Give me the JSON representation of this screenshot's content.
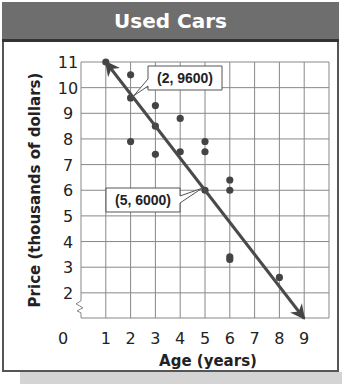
{
  "title": "Used Cars",
  "chart_data": {
    "type": "scatter",
    "title": "Used Cars",
    "xlabel": "Age (years)",
    "ylabel": "Price (thousands of dollars)",
    "xlim": [
      0,
      10
    ],
    "ylim": [
      0,
      11
    ],
    "y_axis_break": true,
    "grid": true,
    "x_ticks": [
      "0",
      "1",
      "2",
      "3",
      "4",
      "5",
      "6",
      "7",
      "8",
      "9"
    ],
    "y_ticks": [
      "11",
      "10",
      "9",
      "8",
      "7",
      "6",
      "5",
      "4",
      "3",
      "2"
    ],
    "y_zero_label": "0",
    "points": [
      {
        "x": 1,
        "y": 11.0
      },
      {
        "x": 2,
        "y": 10.5
      },
      {
        "x": 2,
        "y": 9.6
      },
      {
        "x": 2,
        "y": 7.9
      },
      {
        "x": 3,
        "y": 9.3
      },
      {
        "x": 3,
        "y": 8.5
      },
      {
        "x": 3,
        "y": 7.4
      },
      {
        "x": 4,
        "y": 8.8
      },
      {
        "x": 4,
        "y": 7.5
      },
      {
        "x": 5,
        "y": 7.9
      },
      {
        "x": 5,
        "y": 7.5
      },
      {
        "x": 5,
        "y": 6.0
      },
      {
        "x": 6,
        "y": 6.4
      },
      {
        "x": 6,
        "y": 6.0
      },
      {
        "x": 6,
        "y": 3.4
      },
      {
        "x": 6,
        "y": 3.3
      },
      {
        "x": 8,
        "y": 2.6
      }
    ],
    "trend_line": {
      "from": {
        "x": 1,
        "y": 11.0
      },
      "to": {
        "x": 9,
        "y": 1.0
      },
      "arrows": "both"
    },
    "annotations": [
      {
        "label": "(2, 9600)",
        "x": 2,
        "y": 9.6
      },
      {
        "label": "(5, 6000)",
        "x": 5,
        "y": 6.0
      }
    ]
  }
}
